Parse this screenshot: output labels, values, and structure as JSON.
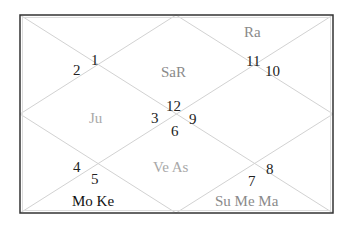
{
  "chart": {
    "style": "North Indian",
    "frame": {
      "x": 20,
      "y": 15,
      "width": 313,
      "height": 198
    },
    "colors": {
      "frame": "#333333",
      "lines": "#cfcfcf",
      "numbers": "#222222"
    },
    "house_numbers": {
      "h1": "1",
      "h2": "2",
      "h3": "3",
      "h4": "4",
      "h5": "5",
      "h6": "6",
      "h7": "7",
      "h8": "8",
      "h9": "9",
      "h10": "10",
      "h11": "11",
      "h12": "12"
    },
    "planets": {
      "top_center": "SaR",
      "top_right": "Ra",
      "left_center": "Ju",
      "center_bottom": "Ve As",
      "bottom_left": "Mo Ke",
      "bottom_right": "Su Me Ma"
    }
  }
}
